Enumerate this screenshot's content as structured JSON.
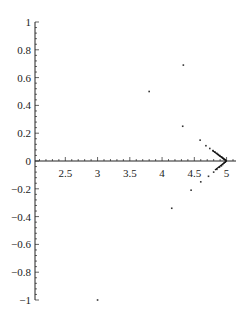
{
  "chart_data": {
    "type": "scatter",
    "title": "",
    "xlabel": "",
    "ylabel": "",
    "xlim": [
      2.03,
      5.13
    ],
    "ylim": [
      -1.0,
      1.0
    ],
    "grid": false,
    "legend": null,
    "x_ticks": [
      2.5,
      3,
      3.5,
      4,
      4.5,
      5
    ],
    "x_tick_labels": [
      "2.5",
      "3",
      "3.5",
      "4",
      "4.5",
      "5"
    ],
    "y_ticks": [
      1,
      0.8,
      0.6,
      0.4,
      0.2,
      0,
      -0.2,
      -0.4,
      -0.6,
      -0.8,
      -1
    ],
    "y_tick_labels": [
      "1",
      "0.8",
      "0.6",
      "0.4",
      "0.2",
      "0",
      "-0.2",
      "-0.4",
      "-0.6",
      "-0.8",
      "-1"
    ],
    "series": [
      {
        "name": "points",
        "x": [
          3.0,
          3.8,
          4.33,
          4.32,
          4.15,
          4.45,
          4.59,
          4.68,
          4.74,
          4.79,
          4.82,
          4.85,
          4.87,
          4.89,
          4.9,
          4.92,
          4.93,
          4.94,
          4.95,
          4.96,
          4.97,
          4.98,
          4.99,
          4.6,
          4.72,
          4.8,
          4.85,
          4.89,
          4.92,
          4.94,
          4.96,
          4.98
        ],
        "y": [
          -1.0,
          0.5,
          0.69,
          0.25,
          -0.34,
          -0.21,
          0.15,
          0.11,
          0.09,
          0.075,
          0.065,
          0.055,
          0.047,
          0.04,
          0.035,
          0.03,
          0.026,
          0.022,
          0.018,
          0.014,
          0.011,
          0.008,
          0.004,
          -0.15,
          -0.11,
          -0.08,
          -0.06,
          -0.045,
          -0.035,
          -0.025,
          -0.015,
          -0.008
        ]
      }
    ]
  }
}
